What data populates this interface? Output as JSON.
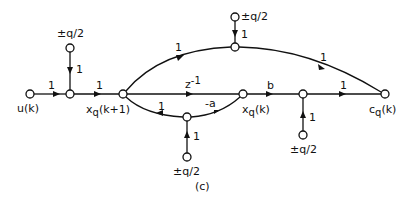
{
  "diagram": {
    "type": "signal-flow-graph",
    "caption": "(c)",
    "nodes": {
      "u": {
        "label": "u(k)",
        "x": 30,
        "y": 94
      },
      "j1": {
        "label": "",
        "x": 70,
        "y": 94
      },
      "src1": {
        "label": "±q/2",
        "x": 70,
        "y": 48
      },
      "xk1": {
        "label": "xq(k+1)",
        "x": 123,
        "y": 94
      },
      "top": {
        "label": "",
        "x": 235,
        "y": 47
      },
      "src_top": {
        "label": "±q/2",
        "x": 235,
        "y": 17
      },
      "low": {
        "label": "",
        "x": 187,
        "y": 117
      },
      "src_low": {
        "label": "±q/2",
        "x": 187,
        "y": 157
      },
      "xk": {
        "label": "xq(k)",
        "x": 243,
        "y": 94
      },
      "j2": {
        "label": "",
        "x": 303,
        "y": 94
      },
      "src_r": {
        "label": "±q/2",
        "x": 303,
        "y": 135
      },
      "c": {
        "label": "cq(k)",
        "x": 385,
        "y": 94
      }
    },
    "edges": [
      {
        "from": "u",
        "to": "j1",
        "gain": "1"
      },
      {
        "from": "src1",
        "to": "j1",
        "gain": "1"
      },
      {
        "from": "j1",
        "to": "xk1",
        "gain": "1"
      },
      {
        "from": "xk1",
        "to": "top",
        "gain": "1"
      },
      {
        "from": "src_top",
        "to": "top",
        "gain": "1"
      },
      {
        "from": "top",
        "to": "c",
        "gain": "1"
      },
      {
        "from": "xk1",
        "to": "xk",
        "gain": "z⁻¹"
      },
      {
        "from": "xk",
        "to": "low",
        "gain": "-a"
      },
      {
        "from": "low",
        "to": "xk1",
        "gain": "1"
      },
      {
        "from": "src_low",
        "to": "low",
        "gain": "1"
      },
      {
        "from": "xk",
        "to": "j2",
        "gain": "b"
      },
      {
        "from": "src_r",
        "to": "j2",
        "gain": "1"
      },
      {
        "from": "j2",
        "to": "c",
        "gain": "1"
      }
    ],
    "labels": {
      "u": "u(k)",
      "xk1_x": "x",
      "xk1_sub": "q",
      "xk1_arg": "(k+1)",
      "xk_x": "x",
      "xk_sub": "q",
      "xk_arg": "(k)",
      "c_c": "c",
      "c_sub": "q",
      "c_arg": "(k)",
      "src1": "±q/2",
      "src_top": "±q/2",
      "src_low": "±q/2",
      "src_r": "±q/2",
      "g_u_j1": "1",
      "g_src1": "1",
      "g_j1_xk1": "1",
      "g_xk1_top": "1",
      "g_srctop": "1",
      "g_top_c": "1",
      "g_z": "z",
      "g_z_exp": "-1",
      "g_a": "-a",
      "g_low_xk1": "1",
      "g_srclow": "1",
      "g_b": "b",
      "g_srcr": "1",
      "g_j2_c": "1",
      "caption": "(c)"
    }
  }
}
